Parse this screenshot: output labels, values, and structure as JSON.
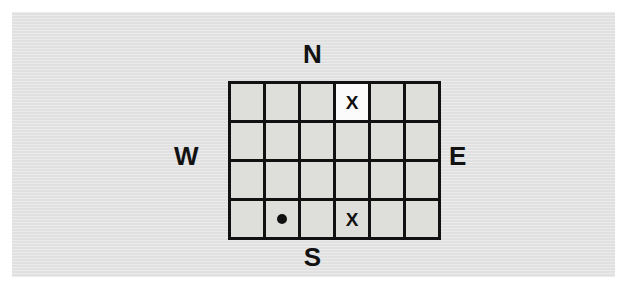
{
  "figure": {
    "background_color": "#ffffff",
    "panel_color": "#e3e3e3"
  },
  "compass": {
    "north": "N",
    "south": "S",
    "west": "W",
    "east": "E"
  },
  "grid": {
    "columns": 6,
    "rows": 4,
    "line_color": "#111111",
    "cell_color": "#dededb",
    "highlight_color": "#fbfbfb",
    "mark_color": "#111111",
    "cells": [
      [
        {
          "mark": "",
          "highlight": false
        },
        {
          "mark": "",
          "highlight": false
        },
        {
          "mark": "",
          "highlight": false
        },
        {
          "mark": "X",
          "highlight": true
        },
        {
          "mark": "",
          "highlight": false
        },
        {
          "mark": "",
          "highlight": false
        }
      ],
      [
        {
          "mark": "",
          "highlight": false
        },
        {
          "mark": "",
          "highlight": false
        },
        {
          "mark": "",
          "highlight": false
        },
        {
          "mark": "",
          "highlight": false
        },
        {
          "mark": "",
          "highlight": false
        },
        {
          "mark": "",
          "highlight": false
        }
      ],
      [
        {
          "mark": "",
          "highlight": false
        },
        {
          "mark": "",
          "highlight": false
        },
        {
          "mark": "",
          "highlight": false
        },
        {
          "mark": "",
          "highlight": false
        },
        {
          "mark": "",
          "highlight": false
        },
        {
          "mark": "",
          "highlight": false
        }
      ],
      [
        {
          "mark": "",
          "highlight": false
        },
        {
          "mark": "dot",
          "highlight": false
        },
        {
          "mark": "",
          "highlight": false
        },
        {
          "mark": "X",
          "highlight": false
        },
        {
          "mark": "",
          "highlight": false
        },
        {
          "mark": "",
          "highlight": false
        }
      ]
    ]
  }
}
